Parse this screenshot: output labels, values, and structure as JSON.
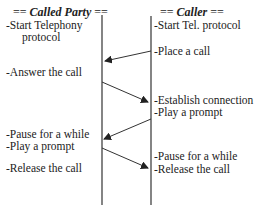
{
  "left_party": {
    "header_prefix": "== ",
    "header_name": "Called Party",
    "header_suffix": " ==",
    "steps": [
      {
        "text": "-Start Telephony",
        "x": 6,
        "y": 21
      },
      {
        "text": "protocol",
        "x": 22,
        "y": 33
      },
      {
        "text": "-Answer the call",
        "x": 6,
        "y": 68
      },
      {
        "text": "-Pause for a while",
        "x": 6,
        "y": 131
      },
      {
        "text": "-Play a prompt",
        "x": 6,
        "y": 143
      },
      {
        "text": "-Release the call",
        "x": 6,
        "y": 164
      }
    ]
  },
  "right_party": {
    "header_prefix": "== ",
    "header_name": "Caller",
    "header_suffix": " ==",
    "steps": [
      {
        "text": "-Start Tel. protocol",
        "x": 154,
        "y": 21
      },
      {
        "text": "-Place a call",
        "x": 154,
        "y": 46
      },
      {
        "text": "-Establish connection",
        "x": 154,
        "y": 96
      },
      {
        "text": "-Play a prompt",
        "x": 154,
        "y": 108
      },
      {
        "text": "-Pause for a while",
        "x": 154,
        "y": 152
      },
      {
        "text": "-Release the call",
        "x": 154,
        "y": 164
      }
    ]
  },
  "messages": [
    {
      "from": "Caller",
      "to": "Called Party",
      "label": "Place a call"
    },
    {
      "from": "Called Party",
      "to": "Caller",
      "label": "Answer the call"
    },
    {
      "from": "Caller",
      "to": "Called Party",
      "label": "Play a prompt"
    },
    {
      "from": "Called Party",
      "to": "Caller",
      "label": "Release the call"
    }
  ],
  "colors": {
    "line": "#333333",
    "text": "#222222",
    "background": "#ffffff"
  }
}
